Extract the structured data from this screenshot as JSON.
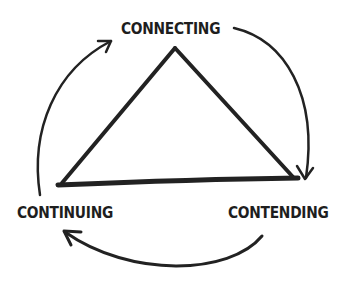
{
  "diagram": {
    "title": "",
    "nodes": [
      {
        "id": "connecting",
        "label": "CONNECTING",
        "position": "top"
      },
      {
        "id": "contending",
        "label": "CONTENDING",
        "position": "bottom-right"
      },
      {
        "id": "continuing",
        "label": "CONTINUING",
        "position": "bottom-left"
      }
    ],
    "edges": [
      {
        "from": "connecting",
        "to": "contending",
        "shape": "curved-arrow"
      },
      {
        "from": "contending",
        "to": "continuing",
        "shape": "curved-arrow"
      },
      {
        "from": "continuing",
        "to": "connecting",
        "shape": "curved-arrow"
      }
    ],
    "center_shape": "triangle",
    "stroke_color": "#222222",
    "background_color": "#ffffff"
  }
}
